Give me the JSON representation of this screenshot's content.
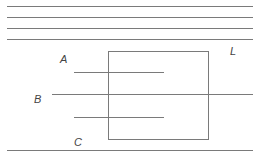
{
  "diagram": {
    "top_lines": [
      {
        "y": 6,
        "x1": 7,
        "x2": 253
      },
      {
        "y": 17,
        "x1": 7,
        "x2": 253
      },
      {
        "y": 28,
        "x1": 7,
        "x2": 253
      },
      {
        "y": 39,
        "x1": 7,
        "x2": 253
      }
    ],
    "box": {
      "x": 108,
      "y": 51,
      "w": 101,
      "h": 89
    },
    "lines": {
      "A": {
        "y": 72,
        "x1": 74,
        "x2": 164
      },
      "B": {
        "y": 94,
        "x1": 52,
        "x2": 253
      },
      "C": {
        "y": 117,
        "x1": 74,
        "x2": 164
      },
      "bottom": {
        "y": 150,
        "x1": 7,
        "x2": 253
      }
    },
    "labels": {
      "A": "A",
      "B": "B",
      "C": "C",
      "L": "L"
    },
    "stroke_color": "#7a7a7a"
  }
}
